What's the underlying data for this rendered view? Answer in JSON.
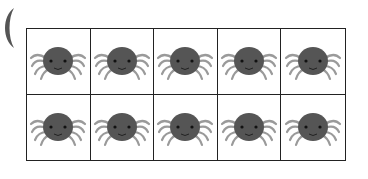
{
  "ten_frame": {
    "rows": 2,
    "columns": 5,
    "filled_count": 10,
    "counter_icon": "spider-icon",
    "cells": [
      {
        "row": 1,
        "col": 1,
        "content": "spider"
      },
      {
        "row": 1,
        "col": 2,
        "content": "spider"
      },
      {
        "row": 1,
        "col": 3,
        "content": "spider"
      },
      {
        "row": 1,
        "col": 4,
        "content": "spider"
      },
      {
        "row": 1,
        "col": 5,
        "content": "spider"
      },
      {
        "row": 2,
        "col": 1,
        "content": "spider"
      },
      {
        "row": 2,
        "col": 2,
        "content": "spider"
      },
      {
        "row": 2,
        "col": 3,
        "content": "spider"
      },
      {
        "row": 2,
        "col": 4,
        "content": "spider"
      },
      {
        "row": 2,
        "col": 5,
        "content": "spider"
      }
    ]
  },
  "decorations": {
    "partial_shape": "crescent-icon"
  },
  "colors": {
    "spider_body": "#555555",
    "spider_legs": "#9a9a9a",
    "grid_line": "#222222",
    "background": "#ffffff"
  }
}
